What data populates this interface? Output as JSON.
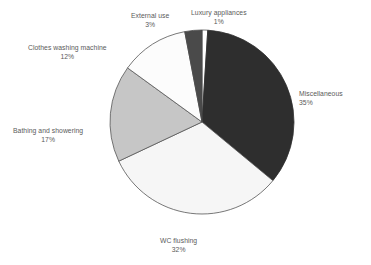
{
  "chart_data": {
    "type": "pie",
    "title": "",
    "subtitle": "",
    "xlabel": "",
    "ylabel": "",
    "legend_position": "none",
    "grid": false,
    "units": "%",
    "start_angle_deg": 0,
    "direction": "clockwise",
    "categories": [
      "Luxury appliances",
      "Miscellaneous",
      "WC flushing",
      "Bathing and showering",
      "Clothes washing machine",
      "External use"
    ],
    "values": [
      1,
      35,
      32,
      17,
      12,
      3
    ],
    "slices": [
      {
        "label": "Luxury appliances",
        "value": 1,
        "value_text": "1%",
        "color": "#ffffff",
        "stroke": "#555555",
        "label_align": "center",
        "label_left": 191,
        "label_top": 9
      },
      {
        "label": "Miscellaneous",
        "value": 35,
        "value_text": "35%",
        "color": "#2e2e2e",
        "stroke": "#2e2e2e",
        "label_align": "left",
        "label_left": 299,
        "label_top": 90
      },
      {
        "label": "WC flushing",
        "value": 32,
        "value_text": "32%",
        "color": "#f6f6f6",
        "stroke": "#555555",
        "label_align": "center",
        "label_left": 160,
        "label_top": 237
      },
      {
        "label": "Bathing and showering",
        "value": 17,
        "value_text": "17%",
        "color": "#c6c6c6",
        "stroke": "#555555",
        "label_align": "center",
        "label_left": 13,
        "label_top": 127
      },
      {
        "label": "Clothes washing machine",
        "value": 12,
        "value_text": "12%",
        "color": "#fcfcfc",
        "stroke": "#555555",
        "label_align": "center",
        "label_left": 28,
        "label_top": 44
      },
      {
        "label": "External use",
        "value": 3,
        "value_text": "3%",
        "color": "#4a4a4a",
        "stroke": "#4a4a4a",
        "label_align": "center",
        "label_left": 131,
        "label_top": 12
      }
    ],
    "geometry": {
      "center_x": 202,
      "center_y": 122,
      "radius": 92
    }
  }
}
